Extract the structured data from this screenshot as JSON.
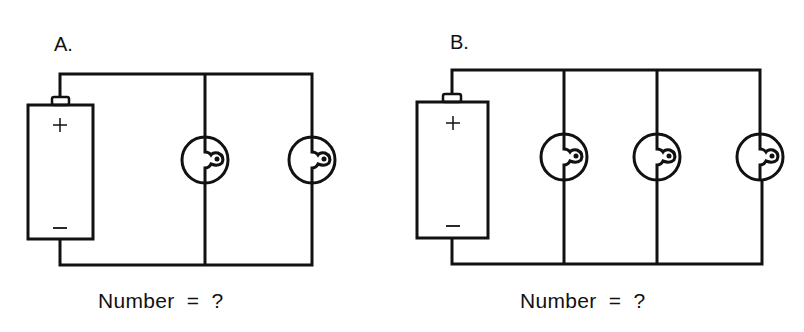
{
  "diagram": {
    "type": "parallel-circuit-comparison",
    "panels": [
      {
        "id": "A",
        "label": "A.",
        "battery": {
          "positive": "+",
          "negative": "−"
        },
        "bulb_count": 2,
        "caption": "Number  =  ?"
      },
      {
        "id": "B",
        "label": "B.",
        "battery": {
          "positive": "+",
          "negative": "−"
        },
        "bulb_count": 3,
        "caption": "Number  =  ?"
      }
    ],
    "colors": {
      "line": "#111111",
      "background": "#ffffff"
    }
  }
}
